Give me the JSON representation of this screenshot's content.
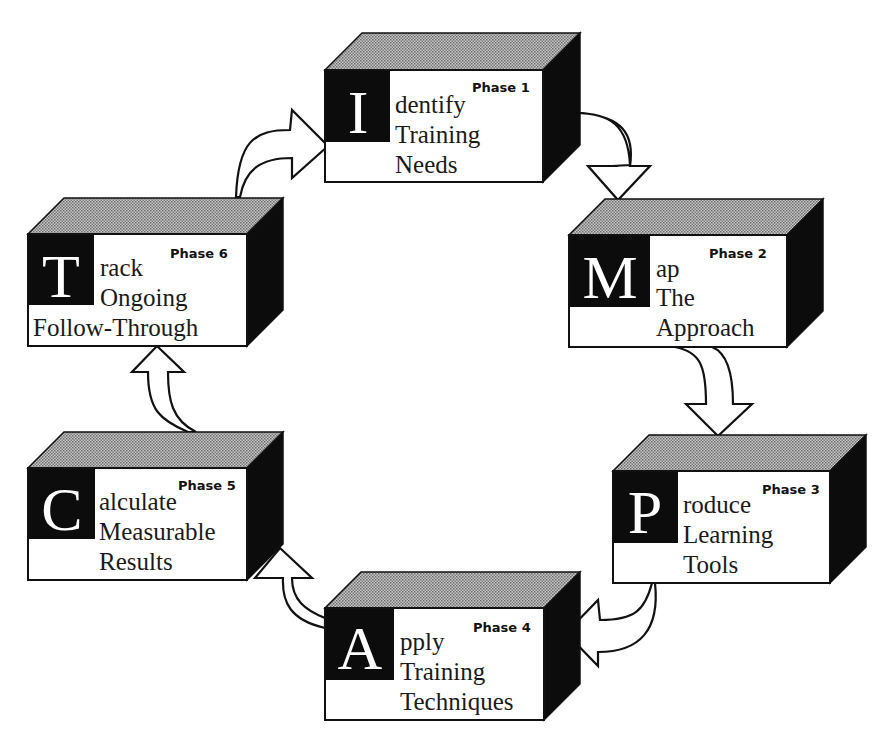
{
  "diagram": {
    "type": "cycle",
    "colors": {
      "face": "#ffffff",
      "side": "#0c0c0c",
      "top_pattern": "#9a9a9a",
      "outline": "#111111"
    },
    "phases": [
      {
        "letter": "I",
        "phase_label": "Phase 1",
        "line1": "dentify",
        "line2": "Training",
        "line3": "Needs"
      },
      {
        "letter": "M",
        "phase_label": "Phase 2",
        "line1": "ap",
        "line2": "The",
        "line3": "Approach"
      },
      {
        "letter": "P",
        "phase_label": "Phase 3",
        "line1": "roduce",
        "line2": "Learning",
        "line3": "Tools"
      },
      {
        "letter": "A",
        "phase_label": "Phase 4",
        "line1": "pply",
        "line2": "Training",
        "line3": "Techniques"
      },
      {
        "letter": "C",
        "phase_label": "Phase 5",
        "line1": "alculate",
        "line2": "Measurable",
        "line3": "Results"
      },
      {
        "letter": "T",
        "phase_label": "Phase 6",
        "line1": "rack",
        "line2": "Ongoing",
        "line3": "Follow-Through"
      }
    ],
    "flow": [
      "Phase 1 → Phase 2",
      "Phase 2 → Phase 3",
      "Phase 3 → Phase 4",
      "Phase 4 → Phase 5",
      "Phase 5 → Phase 6",
      "Phase 6 → Phase 1"
    ]
  }
}
